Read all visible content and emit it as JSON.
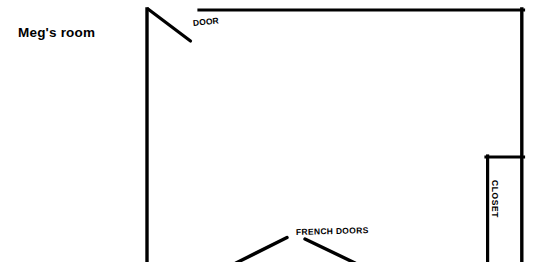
{
  "page": {
    "title": "Meg's room",
    "background_color": "#ffffff",
    "line_color": "#000000",
    "width": 545,
    "height": 262
  },
  "labels": {
    "room": "Meg's room",
    "door": "DOOR",
    "french_doors": "FRENCH DOORS",
    "closet": "CLOSET"
  },
  "floorplan": {
    "type": "architectural-floor-plan",
    "stroke_color": "#000000",
    "wall_thickness": 3.2,
    "walls": [
      {
        "name": "left-wall",
        "x1": 147,
        "y1": 9,
        "x2": 147,
        "y2": 262
      },
      {
        "name": "top-wall",
        "x1": 200,
        "y1": 10,
        "x2": 523,
        "y2": 10
      },
      {
        "name": "right-wall",
        "x1": 522,
        "y1": 10,
        "x2": 522,
        "y2": 262
      },
      {
        "name": "closet-top-wall",
        "x1": 487,
        "y1": 157,
        "x2": 523,
        "y2": 157
      },
      {
        "name": "closet-inner-wall",
        "x1": 488,
        "y1": 157,
        "x2": 488,
        "y2": 262
      }
    ],
    "door_swing": {
      "name": "door-leaf",
      "x1": 148,
      "y1": 9,
      "x2": 190,
      "y2": 41
    },
    "french_doors": [
      {
        "name": "french-door-left-leaf",
        "x1": 238,
        "y1": 262,
        "x2": 287,
        "y2": 238
      },
      {
        "name": "french-door-right-leaf",
        "x1": 306,
        "y1": 240,
        "x2": 353,
        "y2": 262
      }
    ]
  }
}
